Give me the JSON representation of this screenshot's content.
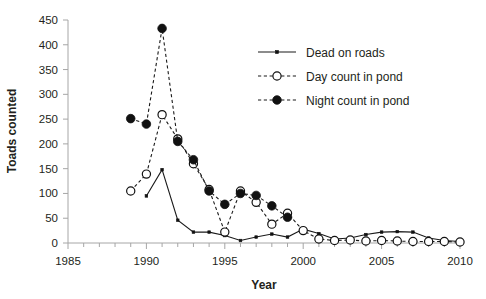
{
  "chart_data": {
    "type": "line",
    "title": "",
    "subtitle": "",
    "xlabel": "Year",
    "ylabel": "Toads counted",
    "xlim": [
      1985,
      2010
    ],
    "ylim": [
      0,
      450
    ],
    "ytick_step": 50,
    "xtick_step": 5,
    "x_minor_tick_step": 1,
    "grid": false,
    "legend_position": "top-right",
    "xticks": [
      "1985",
      "1990",
      "1995",
      "2000",
      "2005",
      "2010"
    ],
    "yticks": [
      "0",
      "50",
      "100",
      "150",
      "200",
      "250",
      "300",
      "350",
      "400",
      "450"
    ],
    "series": [
      {
        "name": "Dead on roads",
        "style": "solid",
        "marker": "small-filled-square",
        "color": "#111111",
        "x": [
          1990,
          1991,
          1992,
          1993,
          1994,
          1995,
          1996,
          1997,
          1998,
          1999,
          2000,
          2001,
          2002,
          2003,
          2004,
          2005,
          2006,
          2007,
          2008,
          2009,
          2010
        ],
        "values": [
          95,
          148,
          46,
          22,
          22,
          15,
          5,
          12,
          18,
          12,
          28,
          19,
          8,
          10,
          17,
          22,
          23,
          22,
          10,
          5,
          3
        ]
      },
      {
        "name": "Day count in pond",
        "style": "dashed",
        "marker": "open-circle",
        "color": "#111111",
        "x": [
          1989,
          1990,
          1991,
          1992,
          1993,
          1994,
          1995,
          1996,
          1997,
          1998,
          1999,
          2000,
          2001,
          2002,
          2003,
          2004,
          2005,
          2006,
          2007,
          2008,
          2009,
          2010
        ],
        "values": [
          105,
          139,
          259,
          210,
          160,
          108,
          22,
          105,
          82,
          38,
          60,
          25,
          8,
          5,
          6,
          4,
          5,
          4,
          3,
          3,
          3,
          2
        ]
      },
      {
        "name": "Night count in pond",
        "style": "dashed",
        "marker": "filled-circle",
        "color": "#111111",
        "x": [
          1989,
          1990,
          1991,
          1992,
          1993,
          1994,
          1995,
          1996,
          1997,
          1998,
          1999
        ],
        "values": [
          251,
          240,
          433,
          205,
          168,
          105,
          78,
          100,
          96,
          75,
          52
        ]
      }
    ]
  },
  "legend": {
    "entries": [
      {
        "label": "Dead on roads",
        "marker": "small-filled-square",
        "line": "solid"
      },
      {
        "label": "Day count in pond",
        "marker": "open-circle",
        "line": "dashed"
      },
      {
        "label": "Night count in pond",
        "marker": "filled-circle",
        "line": "dashed"
      }
    ]
  },
  "axes": {
    "x_title": "Year",
    "y_title": "Toads counted"
  }
}
